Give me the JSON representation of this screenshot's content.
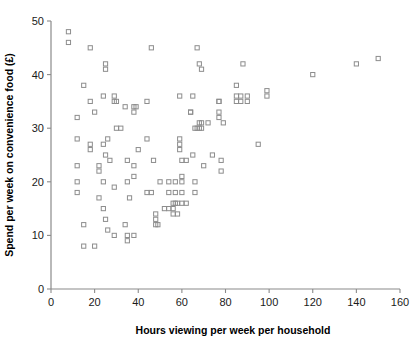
{
  "chart_data": {
    "type": "scatter",
    "title": "",
    "xlabel": "Hours viewing per week per household",
    "ylabel": "Spend per week on convenience food (£)",
    "xlim": [
      0,
      160
    ],
    "ylim": [
      0,
      50
    ],
    "xticks": [
      0,
      20,
      40,
      60,
      80,
      100,
      120,
      140,
      160
    ],
    "yticks": [
      0,
      10,
      20,
      30,
      40,
      50
    ],
    "grid": false,
    "legend": false,
    "marker": "open-square",
    "marker_color": "#8d8d8d",
    "series": [
      {
        "name": "Households",
        "points": [
          [
            8,
            48
          ],
          [
            8,
            46
          ],
          [
            12,
            32
          ],
          [
            12,
            28
          ],
          [
            12,
            23
          ],
          [
            12,
            20
          ],
          [
            12,
            18
          ],
          [
            15,
            38
          ],
          [
            15,
            12
          ],
          [
            15,
            8
          ],
          [
            18,
            45
          ],
          [
            18,
            35
          ],
          [
            18,
            27
          ],
          [
            18,
            26
          ],
          [
            20,
            33
          ],
          [
            20,
            8
          ],
          [
            22,
            23
          ],
          [
            22,
            22
          ],
          [
            22,
            17
          ],
          [
            24,
            36
          ],
          [
            24,
            27
          ],
          [
            24,
            20
          ],
          [
            24,
            15
          ],
          [
            25,
            42
          ],
          [
            25,
            41
          ],
          [
            25,
            25
          ],
          [
            25,
            13
          ],
          [
            26,
            28
          ],
          [
            26,
            11
          ],
          [
            27,
            24
          ],
          [
            29,
            36
          ],
          [
            29,
            35
          ],
          [
            29,
            19
          ],
          [
            29,
            10
          ],
          [
            30,
            35
          ],
          [
            30,
            30
          ],
          [
            32,
            30
          ],
          [
            34,
            34
          ],
          [
            34,
            12
          ],
          [
            35,
            24
          ],
          [
            35,
            20
          ],
          [
            35,
            10
          ],
          [
            35,
            9
          ],
          [
            36,
            17
          ],
          [
            38,
            34
          ],
          [
            38,
            33
          ],
          [
            38,
            23
          ],
          [
            38,
            21
          ],
          [
            38,
            10
          ],
          [
            39,
            34
          ],
          [
            40,
            26
          ],
          [
            44,
            35
          ],
          [
            44,
            28
          ],
          [
            44,
            18
          ],
          [
            46,
            45
          ],
          [
            46,
            18
          ],
          [
            47,
            24
          ],
          [
            48,
            14
          ],
          [
            48,
            13
          ],
          [
            48,
            12
          ],
          [
            49,
            12
          ],
          [
            50,
            20
          ],
          [
            52,
            15
          ],
          [
            54,
            15
          ],
          [
            54,
            20
          ],
          [
            54,
            18
          ],
          [
            56,
            16
          ],
          [
            56,
            15
          ],
          [
            56,
            14
          ],
          [
            57,
            16
          ],
          [
            57,
            18
          ],
          [
            57,
            20
          ],
          [
            58,
            16
          ],
          [
            58,
            14
          ],
          [
            59,
            36
          ],
          [
            59,
            28
          ],
          [
            59,
            27
          ],
          [
            59,
            26
          ],
          [
            60,
            24
          ],
          [
            60,
            21
          ],
          [
            60,
            20
          ],
          [
            60,
            18
          ],
          [
            60,
            16
          ],
          [
            62,
            24
          ],
          [
            62,
            16
          ],
          [
            64,
            33
          ],
          [
            64,
            33
          ],
          [
            65,
            36
          ],
          [
            65,
            25
          ],
          [
            66,
            30
          ],
          [
            66,
            20
          ],
          [
            66,
            18
          ],
          [
            67,
            45
          ],
          [
            67,
            30
          ],
          [
            68,
            42
          ],
          [
            68,
            31
          ],
          [
            68,
            30
          ],
          [
            69,
            41
          ],
          [
            69,
            31
          ],
          [
            69,
            30
          ],
          [
            70,
            23
          ],
          [
            72,
            31
          ],
          [
            74,
            25
          ],
          [
            77,
            35
          ],
          [
            77,
            35
          ],
          [
            77,
            33
          ],
          [
            77,
            32
          ],
          [
            78,
            24
          ],
          [
            78,
            22
          ],
          [
            79,
            31
          ],
          [
            85,
            38
          ],
          [
            85,
            36
          ],
          [
            85,
            35
          ],
          [
            87,
            36
          ],
          [
            87,
            35
          ],
          [
            88,
            42
          ],
          [
            90,
            36
          ],
          [
            90,
            35
          ],
          [
            95,
            27
          ],
          [
            99,
            37
          ],
          [
            99,
            36
          ],
          [
            120,
            40
          ],
          [
            140,
            42
          ],
          [
            150,
            43
          ]
        ]
      }
    ]
  },
  "axes": {
    "x_tick_labels": [
      "0",
      "20",
      "40",
      "60",
      "80",
      "100",
      "120",
      "140",
      "160"
    ],
    "y_tick_labels": [
      "0",
      "10",
      "20",
      "30",
      "40",
      "50"
    ],
    "x_title": "Hours viewing per week per household",
    "y_title": "Spend per week on convenience food (£)"
  }
}
